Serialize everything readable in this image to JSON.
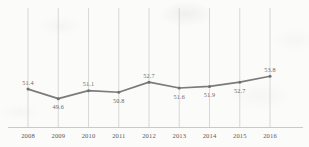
{
  "chart_data": {
    "type": "line",
    "title": "",
    "subtitle": "",
    "xlabel": "",
    "ylabel": "",
    "grid": "vertical",
    "legend": "none",
    "categories": [
      "2008",
      "2009",
      "2010",
      "2011",
      "2012",
      "2013",
      "2014",
      "2015",
      "2016"
    ],
    "values": [
      51.4,
      49.6,
      51.1,
      50.8,
      52.7,
      51.6,
      51.9,
      52.7,
      53.8
    ],
    "value_labels": [
      "51.4",
      "49.6",
      "51.1",
      "50.8",
      "52.7",
      "51.6",
      "51.9",
      "52.7",
      "53.8"
    ],
    "label_positions": [
      "above",
      "below",
      "above",
      "below",
      "above",
      "below",
      "below",
      "below",
      "above"
    ],
    "ylim": [
      48.6,
      54.6
    ],
    "xlim": [
      "2008",
      "2016"
    ],
    "series_color": "#7b7b7b",
    "marker_color": "#6f6f6f",
    "gridline_color": "#c9c9c9",
    "axis_color": "#bdbdbd",
    "text_color": "#5d5d5d",
    "background_color": "#fbfbf9"
  }
}
